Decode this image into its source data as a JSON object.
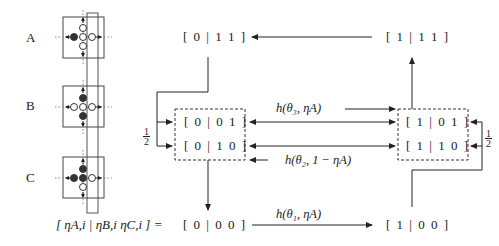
{
  "panels": [
    {
      "label": "A",
      "cells": {
        "up": "open",
        "left": "filled",
        "center": "open",
        "right": "open",
        "down": "open"
      }
    },
    {
      "label": "B",
      "cells": {
        "up": "filled",
        "left": "open",
        "center": "open",
        "right": "open",
        "down": "filled"
      }
    },
    {
      "label": "C",
      "cells": {
        "up": "filled",
        "left": "filled",
        "center": "filled",
        "right": "open",
        "down": "open"
      }
    }
  ],
  "states": {
    "s0_11": "[ 0 | 1 1 ]",
    "s1_11": "[ 1 | 1 1 ]",
    "s0_01": "[ 0 | 0 1 ]",
    "s0_10": "[ 0 | 1 0 ]",
    "s1_01": "[ 1 | 0 1 ]",
    "s1_10": "[ 1 | 1 0 ]",
    "s0_00": "[ 0 | 0 0 ]",
    "s1_00": "[ 1 | 0 0 ]"
  },
  "edges": {
    "top": "h(θ₃, ηA)",
    "middle": "h(θ₂, 1 − ηA)",
    "bottom": "h(θ₁, ηA)"
  },
  "fractions": {
    "left": {
      "num": "1",
      "den": "2"
    },
    "right": {
      "num": "1",
      "den": "2"
    }
  },
  "legend_equation": "[ ηA,i | ηB,i ηC,i ] ="
}
